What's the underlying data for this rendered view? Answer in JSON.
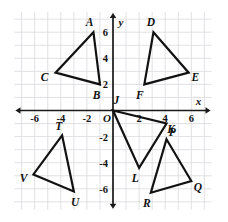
{
  "figure": {
    "kind": "coordinate-plane-with-triangles",
    "background_color": "#ffffff",
    "grid_color": "#d9d9de",
    "axis_color": "#1a1a1a",
    "shape_stroke_color": "#121212",
    "origin_label": "O",
    "x_axis_name": "x",
    "y_axis_name": "y"
  },
  "chart_data": {
    "type": "scatter",
    "title": "",
    "xlabel": "x",
    "ylabel": "y",
    "xlim": [
      -7,
      7
    ],
    "ylim": [
      -7,
      7
    ],
    "grid": true,
    "grid_step": 1,
    "legend": "none",
    "x_ticks": [
      "-6",
      "-4",
      "-2",
      "2",
      "4",
      "6"
    ],
    "x_tick_values": [
      -6,
      -4,
      -2,
      2,
      4,
      6
    ],
    "y_ticks": [
      "6",
      "4",
      "2",
      "-2",
      "-4",
      "-6"
    ],
    "y_tick_values": [
      6,
      4,
      2,
      -2,
      -4,
      -6
    ],
    "origin_tick": "O",
    "series": [
      {
        "name": "triangle-ABC",
        "closed": true,
        "points": [
          {
            "label": "A",
            "x": -1.5,
            "y": 6.0,
            "label_dx": -0.3,
            "label_dy": 0.75
          },
          {
            "label": "C",
            "x": -4.4,
            "y": 2.9,
            "label_dx": -0.85,
            "label_dy": -0.35
          },
          {
            "label": "B",
            "x": -1.0,
            "y": 2.0,
            "label_dx": -0.25,
            "label_dy": -0.8
          }
        ]
      },
      {
        "name": "triangle-DEF",
        "closed": true,
        "points": [
          {
            "label": "D",
            "x": 3.1,
            "y": 6.0,
            "label_dx": -0.2,
            "label_dy": 0.75
          },
          {
            "label": "E",
            "x": 5.8,
            "y": 2.9,
            "label_dx": 0.5,
            "label_dy": -0.3
          },
          {
            "label": "F",
            "x": 2.4,
            "y": 2.0,
            "label_dx": -0.35,
            "label_dy": -0.8
          }
        ]
      },
      {
        "name": "triangle-JKL",
        "closed": true,
        "points": [
          {
            "label": "J",
            "x": 0.0,
            "y": 0.0,
            "label_dx": 0.25,
            "label_dy": 0.8
          },
          {
            "label": "K",
            "x": 4.1,
            "y": -1.0,
            "label_dx": 0.35,
            "label_dy": -0.4
          },
          {
            "label": "L",
            "x": 2.0,
            "y": -4.4,
            "label_dx": -0.3,
            "label_dy": -0.75
          }
        ]
      },
      {
        "name": "triangle-PQR",
        "closed": true,
        "points": [
          {
            "label": "P",
            "x": 4.1,
            "y": -2.2,
            "label_dx": 0.45,
            "label_dy": 0.55
          },
          {
            "label": "Q",
            "x": 6.0,
            "y": -5.4,
            "label_dx": 0.5,
            "label_dy": -0.45
          },
          {
            "label": "R",
            "x": 2.9,
            "y": -6.3,
            "label_dx": -0.3,
            "label_dy": -0.75
          }
        ]
      },
      {
        "name": "triangle-TUV",
        "closed": true,
        "points": [
          {
            "label": "T",
            "x": -3.9,
            "y": -1.9,
            "label_dx": -0.25,
            "label_dy": 0.75
          },
          {
            "label": "V",
            "x": -6.1,
            "y": -4.9,
            "label_dx": -0.75,
            "label_dy": -0.3
          },
          {
            "label": "U",
            "x": -3.0,
            "y": -6.2,
            "label_dx": 0.1,
            "label_dy": -0.8
          }
        ]
      }
    ]
  }
}
